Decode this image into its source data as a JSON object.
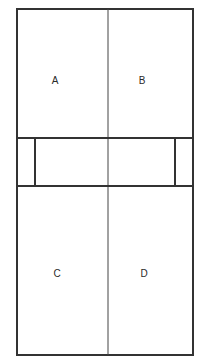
{
  "diagram": {
    "type": "court-layout",
    "colors": {
      "background": "#ffffff",
      "line": "#333333",
      "label": "#2a2a2a"
    },
    "outer_boundary": {
      "x": 17,
      "y": 9,
      "width": 176,
      "height": 346
    },
    "center_line": {
      "x": 108,
      "y1": 9,
      "y2": 355
    },
    "middle_band": {
      "top_y": 138,
      "bottom_y": 186,
      "inner_left_x": 35,
      "inner_right_x": 175
    },
    "zones": [
      {
        "id": "A",
        "label": "A",
        "x": 55,
        "y": 81
      },
      {
        "id": "B",
        "label": "B",
        "x": 142,
        "y": 81
      },
      {
        "id": "C",
        "label": "C",
        "x": 57,
        "y": 274
      },
      {
        "id": "D",
        "label": "D",
        "x": 144,
        "y": 274
      }
    ]
  }
}
